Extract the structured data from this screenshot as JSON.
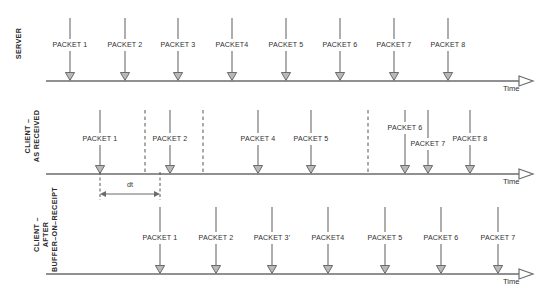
{
  "diagram": {
    "stroke_color": "#6b6b6b",
    "arrow_fill": "#b9b9b9",
    "text_color": "#303030",
    "background": "#ffffff",
    "time_axis_label": "Time",
    "dt_label": "dt"
  },
  "lanes": [
    {
      "id": "server",
      "label_lines": [
        "SERVER"
      ],
      "axis_y": 81,
      "axis_x_start": 46,
      "axis_x_end": 533,
      "tick_top": 18,
      "label_y": 45,
      "packets": [
        {
          "label": "PACKET 1",
          "x": 70
        },
        {
          "label": "PACKET 2",
          "x": 125
        },
        {
          "label": "PACKET 3",
          "x": 178
        },
        {
          "label": "PACKET4",
          "x": 232
        },
        {
          "label": "PACKET 5",
          "x": 286
        },
        {
          "label": "PACKET 6",
          "x": 340
        },
        {
          "label": "PACKET 7",
          "x": 394
        },
        {
          "label": "PACKET 8",
          "x": 448
        }
      ],
      "dashed_lines": []
    },
    {
      "id": "client-as-received",
      "label_lines": [
        "CLIENT –",
        "AS RECEIVED"
      ],
      "axis_y": 174,
      "axis_x_start": 46,
      "axis_x_end": 533,
      "tick_top": 110,
      "label_y": 139,
      "packets": [
        {
          "label": "PACKET 1",
          "x": 100,
          "label_y": 139
        },
        {
          "label": "PACKET 2",
          "x": 170,
          "label_y": 139
        },
        {
          "label": "PACKET 4",
          "x": 258,
          "label_y": 139
        },
        {
          "label": "PACKET 5",
          "x": 311,
          "label_y": 139
        },
        {
          "label": "PACKET 6",
          "x": 405,
          "label_y": 128
        },
        {
          "label": "PACKET 7",
          "x": 428,
          "label_y": 144
        },
        {
          "label": "PACKET 8",
          "x": 470,
          "label_y": 139
        }
      ],
      "dashed_lines": [
        145,
        203,
        368
      ]
    },
    {
      "id": "client-after-buffer-on-receipt",
      "label_lines": [
        "CLIENT –",
        "AFTER",
        "BUFFER–ON–RECEIPT"
      ],
      "axis_y": 274,
      "axis_x_start": 46,
      "axis_x_end": 533,
      "tick_top": 207,
      "label_y": 238,
      "packets": [
        {
          "label": "PACKET 1",
          "x": 160
        },
        {
          "label": "PACKET 2",
          "x": 216
        },
        {
          "label": "PACKET 3'",
          "x": 272
        },
        {
          "label": "PACKET4",
          "x": 328
        },
        {
          "label": "PACKET 5",
          "x": 385
        },
        {
          "label": "PACKET 6",
          "x": 441
        },
        {
          "label": "PACKET 7",
          "x": 498
        }
      ],
      "dashed_lines": []
    }
  ],
  "dt_annotation": {
    "label": "dt",
    "x_start": 100,
    "x_end": 160,
    "y": 194,
    "drop_top": 172,
    "drop_bottom": 200,
    "label_x": 130,
    "label_y": 184
  }
}
